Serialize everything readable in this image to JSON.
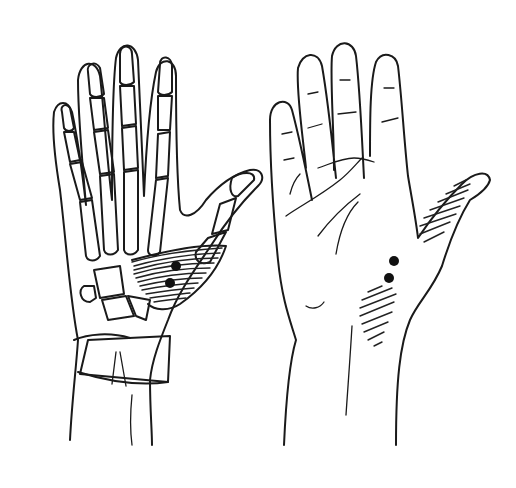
{
  "figure": {
    "title": "Hand anatomy: trigger points of the thenar region",
    "panels": [
      {
        "id": "skeletal-view",
        "label": "Skeletal palmar view of right hand with thenar muscle hatching"
      },
      {
        "id": "surface-view",
        "label": "Surface palmar view of right hand with referred pain zones"
      }
    ],
    "markers": {
      "skeletal_view_points": 2,
      "surface_view_points": 2,
      "hatched_zones_surface": 2
    },
    "colors": {
      "background": "#ffffff",
      "line": "#1a1a1a",
      "dot": "#111111"
    }
  }
}
